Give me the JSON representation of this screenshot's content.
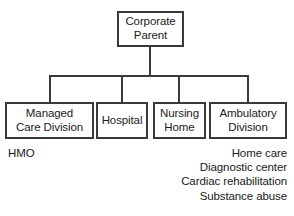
{
  "diagram": {
    "line_color": "#3a3a3a",
    "background_color": "#ffffff",
    "text_color": "#1a1a1a",
    "nodes": {
      "root": {
        "label": "Corporate\nParent"
      },
      "managed_care": {
        "label": "Managed\nCare Division"
      },
      "hospital": {
        "label": "Hospital"
      },
      "nursing_home": {
        "label": "Nursing\nHome"
      },
      "ambulatory": {
        "label": "Ambulatory\nDivision"
      }
    },
    "captions": {
      "left": {
        "parent_node": "Managed Care Division",
        "items": [
          "HMO"
        ]
      },
      "right": {
        "parent_node": "Ambulatory Division",
        "items": [
          "Home care",
          "Diagnostic center",
          "Cardiac rehabilitation",
          "Substance abuse"
        ]
      }
    }
  }
}
